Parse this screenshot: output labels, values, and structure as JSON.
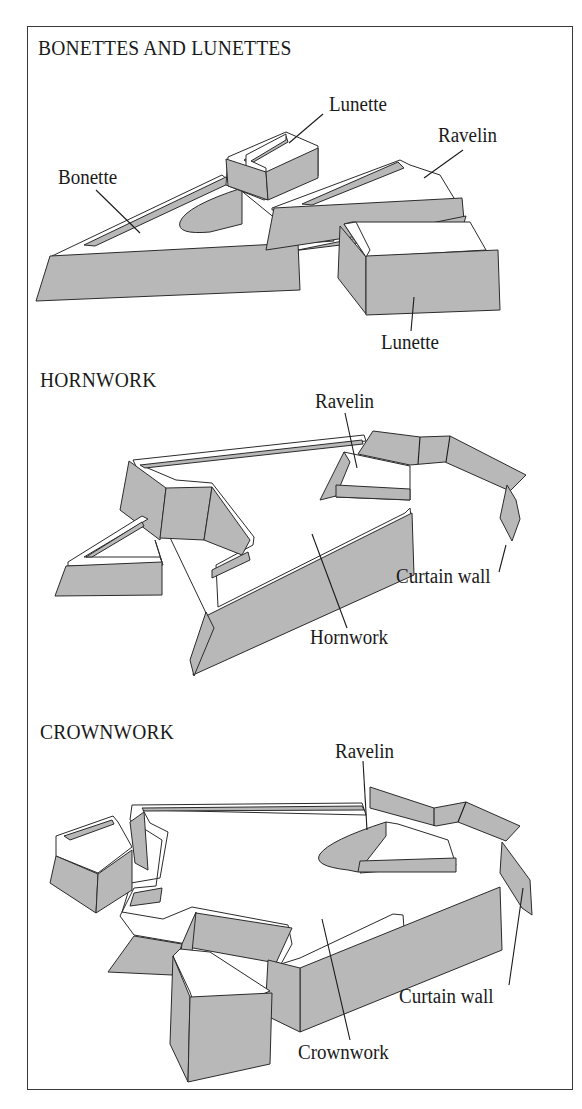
{
  "figure": {
    "background": "#ffffff",
    "wall_fill": "#b8b8b8",
    "line_color": "#2b2b2b",
    "sections": [
      {
        "title": "BONETTES AND LUNETTES",
        "labels": [
          "Lunette",
          "Ravelin",
          "Bonette",
          "Lunette"
        ]
      },
      {
        "title": "HORNWORK",
        "labels": [
          "Ravelin",
          "Curtain wall",
          "Hornwork"
        ]
      },
      {
        "title": "CROWNWORK",
        "labels": [
          "Ravelin",
          "Curtain wall",
          "Crownwork"
        ]
      }
    ]
  }
}
